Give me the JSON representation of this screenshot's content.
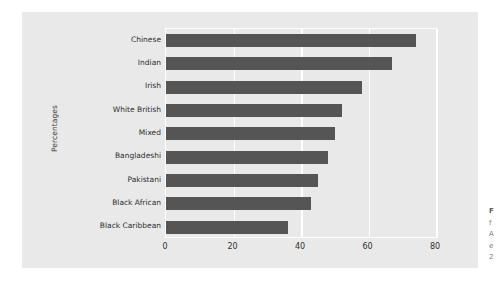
{
  "chart_data": {
    "type": "bar",
    "orientation": "horizontal",
    "title": "",
    "xlabel": "",
    "ylabel": "Percentages",
    "categories": [
      "Chinese",
      "Indian",
      "Irish",
      "White British",
      "Mixed",
      "Bangladeshi",
      "Pakistani",
      "Black African",
      "Black Caribbean"
    ],
    "values": [
      74,
      67,
      58,
      52,
      50,
      48,
      45,
      43,
      36
    ],
    "xlim": [
      0,
      80
    ],
    "xticks": [
      0,
      20,
      40,
      60,
      80
    ],
    "xticklabels": [
      "0",
      "20",
      "40",
      "60",
      "80"
    ],
    "grid": true,
    "legend": false,
    "bar_color": "#555555",
    "panel_color": "#e9e9e9",
    "gridline_color": "#ffffff"
  },
  "caption": {
    "lines": [
      "F",
      "f",
      "A",
      "e",
      "2"
    ]
  }
}
